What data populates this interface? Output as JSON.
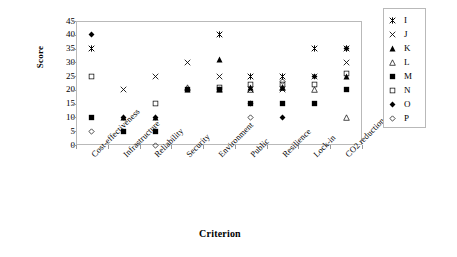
{
  "chart_data": {
    "type": "scatter",
    "title": "",
    "xlabel": "Criterion",
    "ylabel": "Score",
    "ylim": [
      0,
      45
    ],
    "ytick_labels": [
      "0",
      "5",
      "10",
      "15",
      "20",
      "25",
      "30",
      "35",
      "40",
      "45"
    ],
    "ytick_values": [
      0,
      5,
      10,
      15,
      20,
      25,
      30,
      35,
      40,
      45
    ],
    "grid": false,
    "legend_position": "right",
    "categories": [
      "Cost-effectiveness",
      "Infrastructure",
      "Reliability",
      "Security",
      "Environment",
      "Public",
      "Resilience",
      "Lock-in",
      "CO2 reduction"
    ],
    "series": [
      {
        "name": "I",
        "marker": "asterisk",
        "values": [
          35,
          null,
          null,
          null,
          40,
          25,
          25,
          35,
          35
        ]
      },
      {
        "name": "J",
        "marker": "cross",
        "values": [
          null,
          20,
          25,
          30,
          25,
          20,
          20,
          25,
          30
        ]
      },
      {
        "name": "K",
        "marker": "triangle-filled",
        "values": [
          null,
          10,
          10,
          20,
          31,
          21,
          21,
          null,
          25
        ]
      },
      {
        "name": "L",
        "marker": "triangle-open",
        "values": [
          null,
          null,
          null,
          21,
          20,
          20,
          21,
          20,
          10
        ]
      },
      {
        "name": "M",
        "marker": "square-filled",
        "values": [
          10,
          5,
          5,
          20,
          20,
          15,
          15,
          15,
          20
        ]
      },
      {
        "name": "N",
        "marker": "square-open",
        "values": [
          25,
          null,
          15,
          null,
          21,
          22,
          22,
          22,
          26
        ]
      },
      {
        "name": "O",
        "marker": "diamond-filled",
        "values": [
          40,
          10,
          10,
          null,
          null,
          15,
          10,
          25,
          35
        ]
      },
      {
        "name": "P",
        "marker": "diamond-open",
        "values": [
          5,
          null,
          0,
          null,
          null,
          10,
          23,
          null,
          null
        ]
      }
    ],
    "legend_entries": [
      {
        "label": "I",
        "marker": "asterisk"
      },
      {
        "label": "J",
        "marker": "cross"
      },
      {
        "label": "K",
        "marker": "triangle-filled"
      },
      {
        "label": "L",
        "marker": "triangle-open"
      },
      {
        "label": "M",
        "marker": "square-filled"
      },
      {
        "label": "N",
        "marker": "square-open"
      },
      {
        "label": "O",
        "marker": "diamond-filled"
      },
      {
        "label": "P",
        "marker": "diamond-open"
      }
    ],
    "colors": {
      "marker": "#000000",
      "axis": "#b9b9b9",
      "text": "#000000",
      "background": "#ffffff"
    }
  }
}
